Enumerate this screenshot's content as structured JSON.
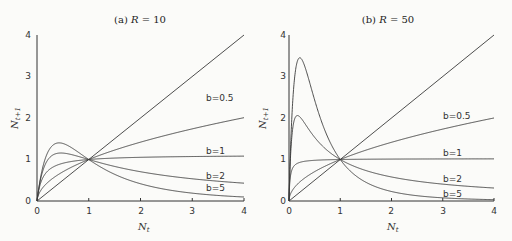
{
  "chart_data": [
    {
      "type": "line",
      "title": "(a) R = 10",
      "title_parts": {
        "prefix": "(a) ",
        "var": "R",
        "suffix": " = 10"
      },
      "R": 10,
      "model": "N_{t+1} = R N_t / (1 + a N_t)^b, a = R^(1/b) - 1",
      "xlabel": "N_t",
      "ylabel": "N_{t+1}",
      "xlim": [
        0,
        4
      ],
      "ylim": [
        0,
        4
      ],
      "xticks": [
        "0",
        "1",
        "2",
        "3",
        "4"
      ],
      "yticks": [
        "0",
        "1",
        "2",
        "3",
        "4"
      ],
      "grid": false,
      "series": [
        {
          "name": "N_{t+1} = N_t",
          "b": null,
          "x": [
            0,
            4
          ],
          "y": [
            0,
            4
          ]
        },
        {
          "name": "b=0.5",
          "b": 0.5,
          "x": [
            0,
            0.5,
            1,
            2,
            3,
            4
          ],
          "y": [
            0,
            0.7,
            1.0,
            1.42,
            1.74,
            2.01
          ]
        },
        {
          "name": "b=1",
          "b": 1,
          "x": [
            0,
            0.25,
            0.5,
            1,
            2,
            3,
            4
          ],
          "y": [
            0,
            0.77,
            0.91,
            1.0,
            1.05,
            1.07,
            1.08
          ]
        },
        {
          "name": "b=2",
          "b": 2,
          "x": [
            0,
            0.25,
            0.46,
            1,
            2,
            3,
            4
          ],
          "y": [
            0,
            1.03,
            1.16,
            1.0,
            0.7,
            0.54,
            0.43
          ]
        },
        {
          "name": "b=5",
          "b": 5,
          "x": [
            0,
            0.2,
            0.43,
            1,
            2,
            3,
            4
          ],
          "y": [
            0,
            1.25,
            1.4,
            1.0,
            0.32,
            0.13,
            0.06
          ]
        }
      ],
      "legend_labels": [
        "b=0.5",
        "b=1",
        "b=2",
        "b=5"
      ]
    },
    {
      "type": "line",
      "title": "(b) R = 50",
      "title_parts": {
        "prefix": "(b) ",
        "var": "R",
        "suffix": " = 50"
      },
      "R": 50,
      "model": "N_{t+1} = R N_t / (1 + a N_t)^b, a = R^(1/b) - 1",
      "xlabel": "N_t",
      "ylabel": "N_{t+1}",
      "xlim": [
        0,
        4
      ],
      "ylim": [
        0,
        4
      ],
      "xticks": [
        "0",
        "1",
        "2",
        "3",
        "4"
      ],
      "yticks": [
        "0",
        "1",
        "2",
        "3",
        "4"
      ],
      "grid": false,
      "series": [
        {
          "name": "N_{t+1} = N_t",
          "b": null,
          "x": [
            0,
            4
          ],
          "y": [
            0,
            4
          ]
        },
        {
          "name": "b=0.5",
          "b": 0.5,
          "x": [
            0,
            0.5,
            1,
            2,
            3,
            4
          ],
          "y": [
            0,
            0.71,
            1.0,
            1.41,
            1.73,
            2.0
          ]
        },
        {
          "name": "b=1",
          "b": 1,
          "x": [
            0,
            0.1,
            0.25,
            1,
            2,
            4
          ],
          "y": [
            0,
            0.84,
            0.93,
            1.0,
            1.01,
            1.02
          ]
        },
        {
          "name": "b=2",
          "b": 2,
          "x": [
            0,
            0.165,
            0.5,
            1,
            2,
            3,
            4
          ],
          "y": [
            0,
            2.06,
            1.57,
            1.0,
            0.54,
            0.37,
            0.28
          ]
        },
        {
          "name": "b=5",
          "b": 5,
          "x": [
            0,
            0.1,
            0.21,
            0.5,
            1,
            2,
            4
          ],
          "y": [
            0,
            2.9,
            3.45,
            2.14,
            1.0,
            0.19,
            0.02
          ]
        }
      ],
      "legend_labels": [
        "b=0.5",
        "b=1",
        "b=2",
        "b=5"
      ]
    }
  ],
  "panels": [
    {
      "title_prefix": "(a) ",
      "title_var": "R",
      "title_suffix": " = 10",
      "xlabel_main": "N",
      "xlabel_sub": "t",
      "ylabel_main": "N",
      "ylabel_sub": "t+1",
      "labels": {
        "b05": "b=0.5",
        "b1": "b=1",
        "b2": "b=2",
        "b5": "b=5"
      },
      "ticks": [
        "0",
        "1",
        "2",
        "3",
        "4"
      ]
    },
    {
      "title_prefix": "(b) ",
      "title_var": "R",
      "title_suffix": " = 50",
      "xlabel_main": "N",
      "xlabel_sub": "t",
      "ylabel_main": "N",
      "ylabel_sub": "t+1",
      "labels": {
        "b05": "b=0.5",
        "b1": "b=1",
        "b2": "b=2",
        "b5": "b=5"
      },
      "ticks": [
        "0",
        "1",
        "2",
        "3",
        "4"
      ]
    }
  ],
  "colors": {
    "line": "#3a3a3a",
    "background": "#fbfbf9"
  }
}
